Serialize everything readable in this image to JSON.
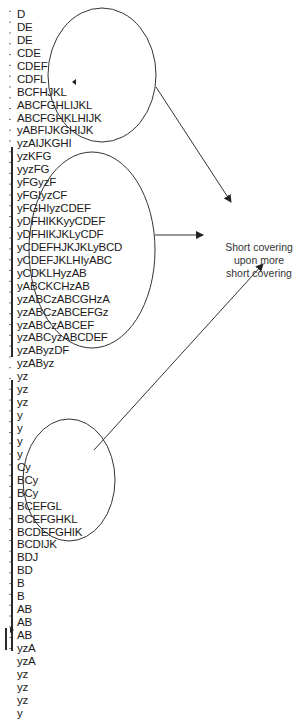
{
  "diagram": {
    "type": "market-profile-tpo",
    "annotation": {
      "line1": "Short covering",
      "line2": "upon more",
      "line3": "short covering"
    },
    "profile_rows": [
      "D",
      "DE",
      "DE",
      "CDE",
      "CDEF",
      "CDFL",
      "BCFHJKL",
      "ABCFGHLIJKL",
      "ABCFGHKLHIJK",
      "yABFIJKGHIJK",
      "yzAIJKGHI",
      "yzKFG",
      "yyzFG",
      "yFGyzF",
      "yFGIyzCF",
      "yFGHIyzCDEF",
      "yDFHIKKyyCDEF",
      "yDFHIKJKLyCDF",
      "yCDEFHJKJKLyBCD",
      "yCDEFJKLHIyABC",
      "yCDKLHyzAB",
      "yABCKCHzAB",
      "yzABCzABCGHzA",
      "yzABCzABCEFGz",
      "yzABCzABCEF",
      "yzABCyzABCDEF",
      "yzAByzDF",
      "yzAByz",
      "yz",
      "yz",
      "yz",
      "y",
      "y",
      "y",
      "y",
      "Cy",
      "BCy",
      "BCy",
      "BCEFGL",
      "BCEFGHKL",
      "BCDEFGHIK",
      "BCDIJK",
      "BDJ",
      "BD",
      "B",
      "B",
      "AB",
      "AB",
      "AB",
      "yzA",
      "yzA",
      "yz",
      "yz",
      "yz",
      "y"
    ],
    "highlighted_regions": [
      {
        "name": "upper-cluster",
        "rows_from": 3,
        "rows_to": 11
      },
      {
        "name": "middle-cluster",
        "rows_from": 12,
        "rows_to": 27
      },
      {
        "name": "lower-cluster",
        "rows_from": 35,
        "rows_to": 43
      }
    ],
    "colors": {
      "text": "#1a1a1a",
      "lines": "#333333",
      "background": "#ffffff"
    }
  }
}
